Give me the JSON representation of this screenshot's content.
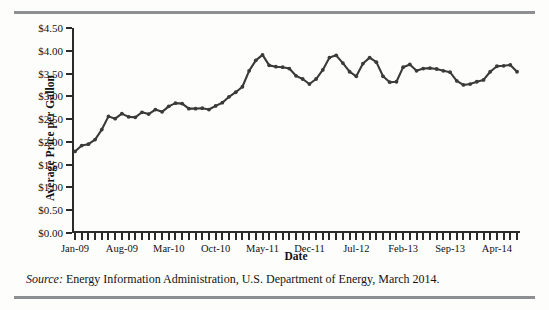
{
  "figure": {
    "ylabel": "Average Price per Gallon",
    "xlabel": "Date",
    "source_prefix": "Source:",
    "source_text": "Energy Information Administration, U.S. Department of Energy, March 2014."
  },
  "chart_data": {
    "type": "line",
    "title": "",
    "xlabel": "Date",
    "ylabel": "Average Price per Gallon",
    "ylim": [
      0,
      4.5
    ],
    "ytick_labels": [
      "$0.00",
      "$0.50",
      "$1.00",
      "$1.50",
      "$2.00",
      "$2.50",
      "$3.00",
      "$3.50",
      "$4.00",
      "$4.50"
    ],
    "ytick_values": [
      0,
      0.5,
      1.0,
      1.5,
      2.0,
      2.5,
      3.0,
      3.5,
      4.0,
      4.5
    ],
    "xtick_labels": [
      "Jan-09",
      "Aug-09",
      "Mar-10",
      "Oct-10",
      "May-11",
      "Dec-11",
      "Jul-12",
      "Feb-13",
      "Sep-13",
      "Apr-14"
    ],
    "xtick_indices": [
      0,
      7,
      14,
      21,
      28,
      35,
      42,
      49,
      56,
      63
    ],
    "grid": false,
    "legend": "none",
    "marker": "filled-circle",
    "line_color": "#3a3a3a",
    "x": [
      "Jan-09",
      "Feb-09",
      "Mar-09",
      "Apr-09",
      "May-09",
      "Jun-09",
      "Jul-09",
      "Aug-09",
      "Sep-09",
      "Oct-09",
      "Nov-09",
      "Dec-09",
      "Jan-10",
      "Feb-10",
      "Mar-10",
      "Apr-10",
      "May-10",
      "Jun-10",
      "Jul-10",
      "Aug-10",
      "Sep-10",
      "Oct-10",
      "Nov-10",
      "Dec-10",
      "Jan-11",
      "Feb-11",
      "Mar-11",
      "Apr-11",
      "May-11",
      "Jun-11",
      "Jul-11",
      "Aug-11",
      "Sep-11",
      "Oct-11",
      "Nov-11",
      "Dec-11",
      "Jan-12",
      "Feb-12",
      "Mar-12",
      "Apr-12",
      "May-12",
      "Jun-12",
      "Jul-12",
      "Aug-12",
      "Sep-12",
      "Oct-12",
      "Nov-12",
      "Dec-12",
      "Jan-13",
      "Feb-13",
      "Mar-13",
      "Apr-13",
      "May-13",
      "Jun-13",
      "Jul-13",
      "Aug-13",
      "Sep-13",
      "Oct-13",
      "Nov-13",
      "Dec-13",
      "Jan-14",
      "Feb-14",
      "Mar-14",
      "Apr-14",
      "May-14",
      "Jun-14",
      "Jul-14"
    ],
    "values": [
      1.79,
      1.92,
      1.95,
      2.05,
      2.27,
      2.56,
      2.51,
      2.62,
      2.55,
      2.54,
      2.65,
      2.61,
      2.71,
      2.66,
      2.78,
      2.85,
      2.84,
      2.73,
      2.73,
      2.74,
      2.71,
      2.79,
      2.86,
      2.99,
      3.09,
      3.21,
      3.56,
      3.79,
      3.91,
      3.68,
      3.65,
      3.64,
      3.61,
      3.45,
      3.38,
      3.27,
      3.38,
      3.58,
      3.85,
      3.9,
      3.73,
      3.54,
      3.44,
      3.72,
      3.85,
      3.75,
      3.44,
      3.31,
      3.32,
      3.64,
      3.7,
      3.56,
      3.61,
      3.62,
      3.6,
      3.56,
      3.53,
      3.34,
      3.25,
      3.27,
      3.32,
      3.36,
      3.54,
      3.66,
      3.67,
      3.69,
      3.54
    ],
    "series_start_value": 1.79,
    "series_end_value": 3.1,
    "max_value": 3.91,
    "min_value": 1.79,
    "units": "US dollars per gallon"
  }
}
